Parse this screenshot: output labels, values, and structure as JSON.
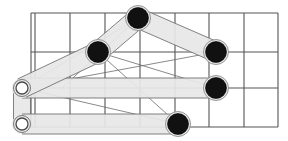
{
  "figure": {
    "type": "line-diagram",
    "width": 288,
    "height": 141,
    "background": "#ffffff"
  },
  "colors": {
    "background": "#ffffff",
    "grid_line": "#555555",
    "link_fill": "#e8e8e8",
    "link_stroke": "#6b6b6b",
    "pin_joint_fill": "#111111",
    "pin_joint_stroke": "#8a8a8a",
    "ground_joint_fill": "#ffffff",
    "ground_joint_stroke": "#4a4a4a"
  },
  "grid": {
    "label": "background-grid",
    "x_left": 31,
    "x_right": 278,
    "y_top": 13,
    "y_bottom": 127,
    "columns": 7,
    "rows": 3,
    "vertical_lines": [
      31,
      35,
      70,
      105,
      140,
      175,
      209,
      244,
      278
    ],
    "horizontal_lines": [
      13,
      52,
      88,
      127
    ],
    "stroke_width": 1.1,
    "double_left_edge": true
  },
  "joints": {
    "pin_joints": [
      {
        "name": "joint-top",
        "cx": 138,
        "cy": 18,
        "r": 10.5,
        "halo_r": 12.5
      },
      {
        "name": "joint-mid-left",
        "cx": 98,
        "cy": 52,
        "r": 10.5,
        "halo_r": 12.5
      },
      {
        "name": "joint-right-upper",
        "cx": 216,
        "cy": 52,
        "r": 10.5,
        "halo_r": 12.5
      },
      {
        "name": "joint-right-lower",
        "cx": 216,
        "cy": 88,
        "r": 10.5,
        "halo_r": 12.5
      },
      {
        "name": "joint-bottom",
        "cx": 178,
        "cy": 124,
        "r": 10.5,
        "halo_r": 12.5
      }
    ],
    "ground_joints": [
      {
        "name": "ground-pivot-upper",
        "cx": 22,
        "cy": 88,
        "r_outer": 8.5,
        "r_inner": 6.0
      },
      {
        "name": "ground-pivot-lower",
        "cx": 22,
        "cy": 124,
        "r_outer": 8.5,
        "r_inner": 6.0
      }
    ]
  },
  "links": [
    {
      "name": "link-ground-crank",
      "from": "ground-pivot-upper",
      "to": "ground-pivot-lower",
      "x1": 22,
      "y1": 88,
      "x2": 22,
      "y2": 124,
      "half_width": 8.5
    },
    {
      "name": "link-lower-rocker",
      "from": "ground-pivot-lower",
      "to": "joint-bottom",
      "x1": 22,
      "y1": 124,
      "x2": 178,
      "y2": 124,
      "half_width": 10.0
    },
    {
      "name": "link-coupler-long",
      "from": "ground-pivot-upper",
      "to": "joint-right-lower",
      "x1": 22,
      "y1": 88,
      "x2": 216,
      "y2": 88,
      "half_width": 10.0
    },
    {
      "name": "link-crank-lower",
      "from": "ground-pivot-upper",
      "to": "joint-mid-left",
      "x1": 22,
      "y1": 88,
      "x2": 98,
      "y2": 52,
      "half_width": 10.0
    },
    {
      "name": "link-crank-upper",
      "from": "joint-mid-left",
      "to": "joint-top",
      "x1": 98,
      "y1": 52,
      "x2": 138,
      "y2": 18,
      "half_width": 10.0
    },
    {
      "name": "link-top-rocker",
      "from": "joint-top",
      "to": "joint-right-upper",
      "x1": 138,
      "y1": 18,
      "x2": 216,
      "y2": 52,
      "half_width": 10.0
    }
  ],
  "guide_lines": [
    {
      "name": "guide-ground-to-top",
      "x1": 22,
      "y1": 88,
      "x2": 138,
      "y2": 18
    },
    {
      "name": "guide-ground-to-right-upper",
      "x1": 22,
      "y1": 88,
      "x2": 216,
      "y2": 52
    },
    {
      "name": "guide-mid-to-right-lower",
      "x1": 98,
      "y1": 52,
      "x2": 216,
      "y2": 88
    },
    {
      "name": "guide-mid-to-bottom",
      "x1": 98,
      "y1": 52,
      "x2": 178,
      "y2": 124
    },
    {
      "name": "guide-ground-to-bottom",
      "x1": 22,
      "y1": 88,
      "x2": 178,
      "y2": 124
    },
    {
      "name": "guide-top-to-mid-extend",
      "x1": 138,
      "y1": 18,
      "x2": 62,
      "y2": 88
    }
  ]
}
